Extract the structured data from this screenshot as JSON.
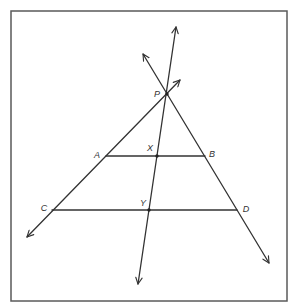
{
  "diagram": {
    "type": "geometry-figure",
    "labels": {
      "P": "P",
      "A": "A",
      "X": "X",
      "B": "B",
      "C": "C",
      "Y": "Y",
      "D": "D"
    },
    "points": {
      "P": [
        167,
        94
      ],
      "A": [
        106,
        156
      ],
      "X": [
        157,
        156
      ],
      "B": [
        205,
        156
      ],
      "C": [
        52,
        210
      ],
      "Y": [
        149,
        210
      ],
      "D": [
        237,
        210
      ]
    },
    "lines": [
      {
        "name": "line-CAP",
        "through": [
          "C",
          "A",
          "P"
        ],
        "arrows": "both"
      },
      {
        "name": "line-PBD",
        "through": [
          "P",
          "B",
          "D"
        ],
        "arrows": "both"
      },
      {
        "name": "line-PXY",
        "through": [
          "P",
          "X",
          "Y"
        ],
        "arrows": "both"
      }
    ],
    "segments": [
      {
        "name": "segment-AB",
        "from": "A",
        "to": "B"
      },
      {
        "name": "segment-CD",
        "from": "C",
        "to": "D"
      }
    ]
  }
}
